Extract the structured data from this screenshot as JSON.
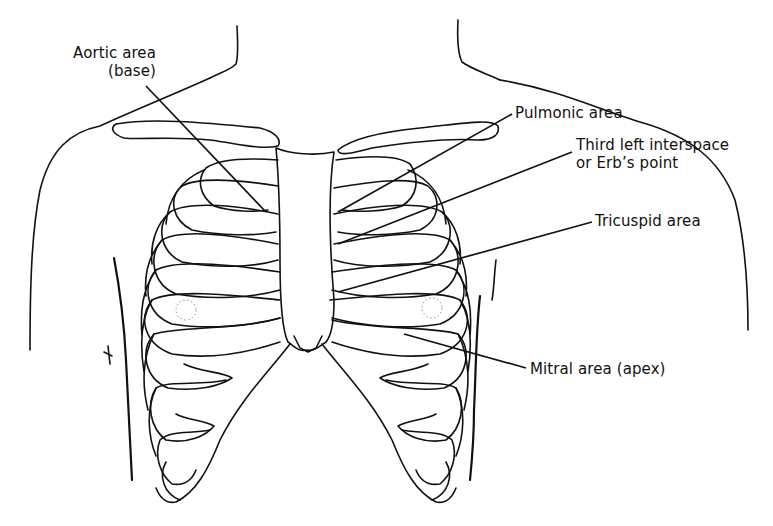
{
  "diagram": {
    "line_color": "#111111",
    "background": "#ffffff",
    "labels": {
      "aortic": {
        "line1": "Aortic area",
        "line2": "(base)"
      },
      "pulmonic": {
        "line1": "Pulmonic area"
      },
      "erb": {
        "line1": "Third left interspace",
        "line2": "or Erb’s point"
      },
      "tricuspid": {
        "line1": "Tricuspid area"
      },
      "mitral": {
        "line1": "Mitral area (apex)"
      }
    }
  }
}
